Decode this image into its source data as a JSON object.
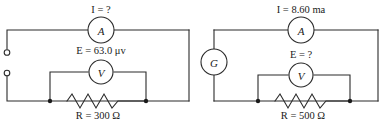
{
  "figure": {
    "background_color": "#ffffff",
    "line_color": "#2b2b2b"
  },
  "circuits": [
    {
      "id": "left-circuit",
      "name": "left-circuit",
      "current_label": "I = ?",
      "emf_label": "E = 63.0 μv",
      "resistor_label": "R = 300 Ω",
      "ammeter_symbol": "A",
      "voltmeter_symbol": "V",
      "has_source_symbol": false,
      "source_symbol": "",
      "has_terminals": true,
      "terminal_count": 2
    },
    {
      "id": "right-circuit",
      "name": "right-circuit",
      "current_label": "I = 8.60 ma",
      "emf_label": "E = ?",
      "resistor_label": "R = 500 Ω",
      "ammeter_symbol": "A",
      "voltmeter_symbol": "V",
      "has_source_symbol": true,
      "source_symbol": "G",
      "has_terminals": false,
      "terminal_count": 0
    }
  ]
}
